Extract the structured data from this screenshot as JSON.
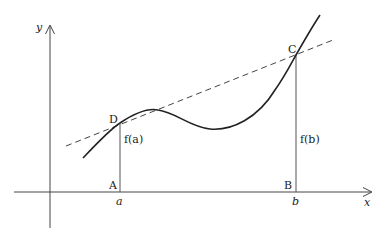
{
  "diagram": {
    "axes": {
      "x_label": "x",
      "y_label": "y"
    },
    "points": {
      "D": "D",
      "C": "C",
      "A": "A",
      "B": "B"
    },
    "ticks": {
      "a": "a",
      "b": "b"
    },
    "heights": {
      "fa": "f(a)",
      "fb": "f(b)"
    },
    "colors": {
      "curve": "#222222",
      "axes": "#444444",
      "secant": "#444444"
    }
  }
}
